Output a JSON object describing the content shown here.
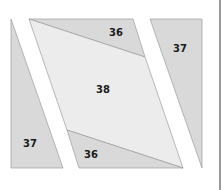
{
  "diagram": {
    "colors": {
      "dark_piece": "#d9d9d9",
      "light_piece": "#ececec",
      "outline": "#9c9c9c",
      "divider": "#9a9a9a"
    },
    "pieces": [
      {
        "id": "left-37",
        "label": "37",
        "points": "11,19 63,168 11,168",
        "fill": "dark",
        "label_pos": [
          30,
          147
        ]
      },
      {
        "id": "top-36",
        "label": "36",
        "points": "29,19 133,19 145,57",
        "fill": "dark",
        "label_pos": [
          116,
          36
        ]
      },
      {
        "id": "center-38",
        "label": "38",
        "points": "29,19 145,57 183,168 67,130",
        "fill": "light",
        "label_pos": [
          103,
          93
        ]
      },
      {
        "id": "bottom-36",
        "label": "36",
        "points": "67,130 183,168 79,168",
        "fill": "dark",
        "label_pos": [
          91,
          158
        ]
      },
      {
        "id": "right-37",
        "label": "37",
        "points": "150,19 202,19 202,168",
        "fill": "dark",
        "label_pos": [
          180,
          52
        ]
      }
    ]
  }
}
